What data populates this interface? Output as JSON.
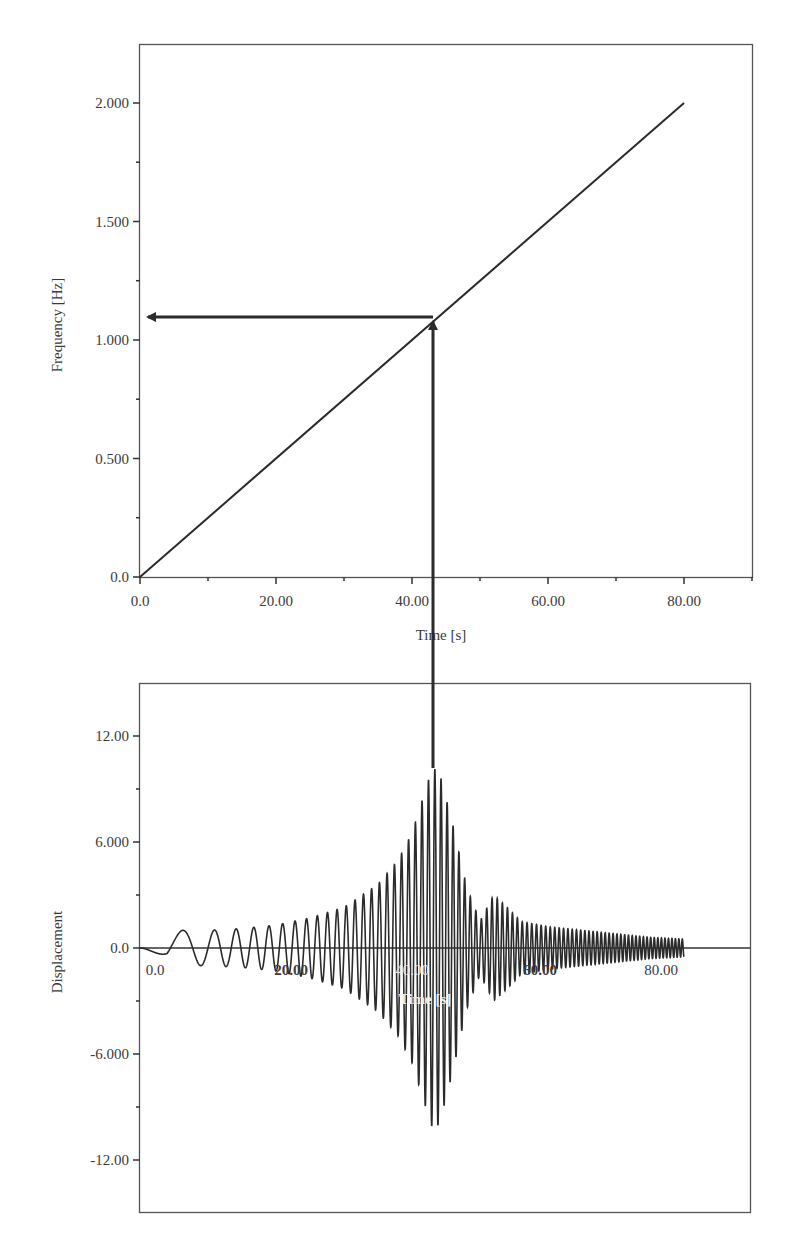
{
  "chart_data": [
    {
      "type": "line",
      "title": "",
      "xlabel": "Time [s]",
      "ylabel": "Frequency [Hz]",
      "xlim": [
        0,
        90
      ],
      "ylim": [
        0,
        2.25
      ],
      "x_ticks": [
        0,
        20,
        40,
        60,
        80
      ],
      "x_tick_labels": [
        "0.0",
        "20.00",
        "40.00",
        "60.00",
        "80.00"
      ],
      "x_minor_ticks": [
        10,
        30,
        50,
        70,
        90
      ],
      "y_ticks": [
        0,
        0.5,
        1.0,
        1.5,
        2.0
      ],
      "y_tick_labels": [
        "0.0",
        "0.500",
        "1.000",
        "1.500",
        "2.000"
      ],
      "y_minor_ticks": [
        0.25,
        0.75,
        1.25,
        1.75
      ],
      "grid": false,
      "legend": null,
      "series": [
        {
          "name": "Excitation frequency",
          "x": [
            0,
            80
          ],
          "y": [
            0,
            2.0
          ],
          "color": "#2b2b2b"
        }
      ],
      "annotations": [
        {
          "type": "arrow",
          "description": "Vertical arrow from displacement peak up to frequency line",
          "x": 43.1,
          "y_from_displacement": 10.2,
          "y_to_frequency": 1.09
        },
        {
          "type": "arrow",
          "description": "Horizontal arrow from line to frequency axis",
          "y": 1.09,
          "x_from": 43.1,
          "x_to": 0
        }
      ]
    },
    {
      "type": "line",
      "title": "",
      "xlabel": "Time [s]",
      "ylabel": "Displacement",
      "xlim": [
        0,
        90
      ],
      "ylim": [
        -15,
        15
      ],
      "x_ticks": [
        0,
        20,
        40,
        60,
        80
      ],
      "x_tick_labels": [
        "0.0",
        "20.00",
        "40.00",
        "60.00",
        "80.00"
      ],
      "y_ticks": [
        -12,
        -6,
        0,
        6,
        12
      ],
      "y_tick_labels": [
        "-12.00",
        "-6.000",
        "0.0",
        "6.000",
        "12.00"
      ],
      "y_minor_ticks": [
        -9,
        -3,
        3,
        9
      ],
      "grid": false,
      "legend": null,
      "series": [
        {
          "name": "Displacement response (chirp excitation)",
          "description": "Oscillation whose frequency grows linearly 0 to 2 Hz over 0-80 s; resonance near t=43 s (f about 1.09 Hz)",
          "chirp_rate_hz_per_s": 0.025,
          "t_end": 80,
          "envelope_t": [
            0,
            4,
            10,
            15,
            20,
            25,
            30,
            35,
            38,
            40,
            42,
            43,
            44,
            46,
            48,
            50,
            52,
            54,
            56,
            60,
            65,
            70,
            75,
            80
          ],
          "envelope_amp": [
            0.0,
            1.0,
            1.0,
            1.1,
            1.3,
            1.7,
            2.3,
            3.6,
            5.0,
            6.5,
            9.0,
            10.2,
            10.0,
            7.0,
            3.5,
            1.5,
            3.0,
            2.3,
            1.5,
            1.2,
            1.0,
            0.8,
            0.6,
            0.5
          ],
          "color": "#2b2b2b"
        }
      ]
    }
  ],
  "top_chart": {
    "ylabel": "Frequency [Hz]",
    "xlabel": "Time [s]",
    "x_tick_labels": [
      "0.0",
      "20.00",
      "40.00",
      "60.00",
      "80.00"
    ],
    "y_tick_labels": [
      "0.0",
      "0.500",
      "1.000",
      "1.500",
      "2.000"
    ]
  },
  "bottom_chart": {
    "ylabel": "Displacement",
    "xlabel": "Time [s]",
    "x_tick_labels": [
      "0.0",
      "20.00",
      "40.00",
      "60.00",
      "80.00"
    ],
    "y_tick_labels": [
      "12.00",
      "6.000",
      "0.0",
      "-6.000",
      "-12.00"
    ]
  },
  "colors": {
    "line": "#2b2b2b",
    "frame": "#444444",
    "background": "#ffffff"
  }
}
